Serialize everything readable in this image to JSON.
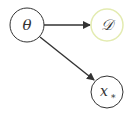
{
  "diagram": {
    "nodes": [
      {
        "id": "theta",
        "label": "θ",
        "cx": 27,
        "cy": 25,
        "r": 17,
        "stroke": "#333333"
      },
      {
        "id": "D",
        "label": "𝒟",
        "cx": 107,
        "cy": 25,
        "r": 16,
        "stroke": "#e3ebb0"
      },
      {
        "id": "xstar",
        "label": "x",
        "sub": "∗",
        "cx": 107,
        "cy": 92,
        "r": 16,
        "stroke": "#333333"
      }
    ],
    "edges": [
      {
        "from": "theta",
        "to": "D"
      },
      {
        "from": "theta",
        "to": "xstar"
      }
    ]
  }
}
